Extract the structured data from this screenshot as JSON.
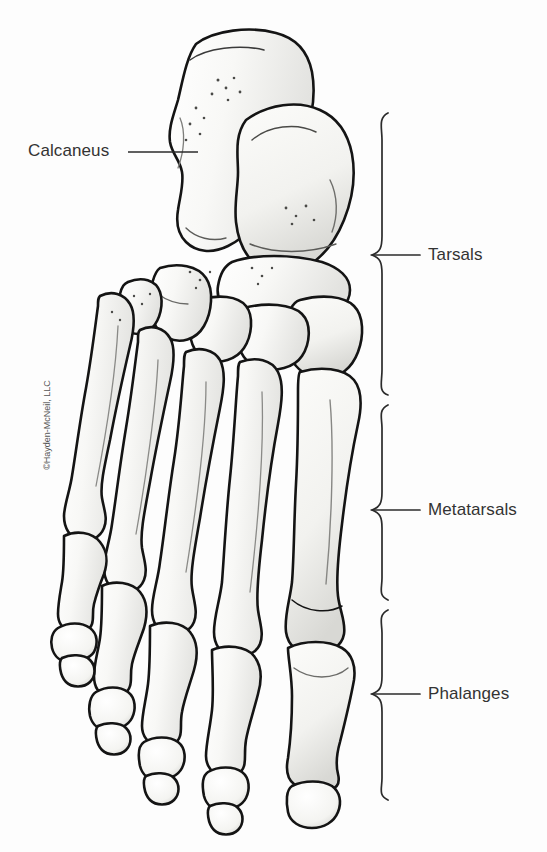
{
  "figure": {
    "background_color": "#fdfdfd",
    "ink_color": "#1a1a1a",
    "text_color": "#333333",
    "bone_fill": "#f7f7f5",
    "bone_shadow": "#c9c9c6"
  },
  "labels": {
    "calcaneus": "Calcaneus",
    "tarsals": "Tarsals",
    "metatarsals": "Metatarsals",
    "phalanges": "Phalanges"
  },
  "copyright": "©Hayden-McNeil, LLC",
  "braces": [
    {
      "name": "tarsals",
      "top": 113,
      "bottom": 395,
      "tip_y": 255
    },
    {
      "name": "metatarsals",
      "top": 405,
      "bottom": 600,
      "tip_y": 510
    },
    {
      "name": "phalanges",
      "top": 610,
      "bottom": 800,
      "tip_y": 694
    }
  ],
  "leader_line": {
    "name": "calcaneus-leader",
    "x1": 128,
    "y1": 152,
    "x2": 198,
    "y2": 152
  }
}
